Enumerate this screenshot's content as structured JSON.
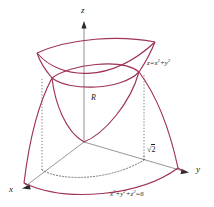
{
  "figure": {
    "axes": {
      "x_label": "x",
      "y_label": "y",
      "z_label": "z"
    },
    "labels": {
      "region": "R",
      "paraboloid_base": "z",
      "paraboloid_eq_rhs": "x",
      "tick_sqrt_symbol": "√",
      "tick_sqrt_value": "2"
    },
    "equations": {
      "paraboloid": {
        "lhs": "z",
        "eq": "=",
        "term1_base": "x",
        "term1_exp": "2",
        "plus": "+",
        "term2_base": "y",
        "term2_exp": "2",
        "full": "z=x²+y²"
      },
      "sphere": {
        "term1_base": "x",
        "term1_exp": "2",
        "plus1": "+",
        "term2_base": "y",
        "term2_exp": "2",
        "plus2": "+",
        "term3_base": "z",
        "term3_exp": "2",
        "eq": "=",
        "rhs": "6",
        "full": "x²+y²+z²=6"
      }
    },
    "colors": {
      "curve": "#9e3258",
      "curve_light": "#b04a6c",
      "axis": "#b9b9bd",
      "axis_dark": "#6f6f74",
      "dotted": "#5a5a5f",
      "text": "#1a1a1a",
      "background": "#ffffff"
    },
    "geometry": {
      "origin": [
        84,
        142
      ],
      "z_axis_top": [
        84,
        24
      ],
      "x_axis_end": [
        12,
        186
      ],
      "y_axis_end": [
        196,
        172
      ],
      "intersection_left": [
        52,
        78
      ],
      "intersection_right": [
        139,
        72
      ],
      "intersection_radius_label_point": [
        154,
        148
      ]
    }
  }
}
